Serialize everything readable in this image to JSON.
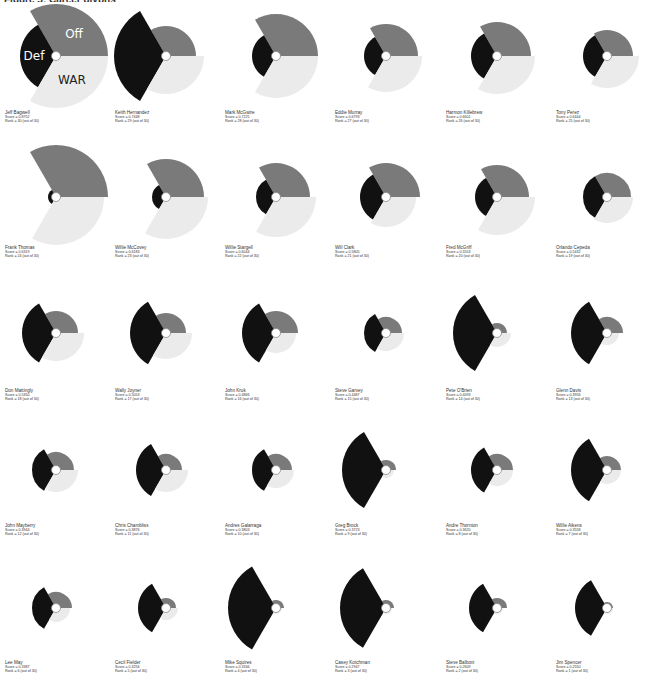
{
  "title": "Figure 5: Career glyphs",
  "chart_data": {
    "type": "radial-glyph-small-multiples",
    "title": "",
    "legend": [
      {
        "key": "Def",
        "color": "#111111",
        "angle_start": 120,
        "angle_end": 240
      },
      {
        "key": "Off",
        "color": "#7a7a7a",
        "angle_start": 0,
        "angle_end": 120
      },
      {
        "key": "WAR",
        "color": "#ebebeb",
        "angle_start": 240,
        "angle_end": 360
      }
    ],
    "grid": {
      "columns": 6,
      "rows": 6
    },
    "players": [
      {
        "name": "Jeff Bagwell",
        "score": "0.8752",
        "rank": "30",
        "def": 36,
        "off": 52,
        "war": 52,
        "show_labels": true
      },
      {
        "name": "Keith Hernandez",
        "score": "0.7448",
        "rank": "29",
        "def": 52,
        "off": 30,
        "war": 38
      },
      {
        "name": "Mark McGwire",
        "score": "0.7225",
        "rank": "28",
        "def": 24,
        "off": 42,
        "war": 42
      },
      {
        "name": "Eddie Murray",
        "score": "0.6793",
        "rank": "27",
        "def": 22,
        "off": 32,
        "war": 36
      },
      {
        "name": "Harmon Killebrew",
        "score": "0.6601",
        "rank": "26",
        "def": 26,
        "off": 34,
        "war": 38
      },
      {
        "name": "Tony Perez",
        "score": "0.6444",
        "rank": "25",
        "def": 24,
        "off": 26,
        "war": 32
      },
      {
        "name": "Frank Thomas",
        "score": "0.6319",
        "rank": "24",
        "def": 8,
        "off": 52,
        "war": 48
      },
      {
        "name": "Willie McCovey",
        "score": "0.6183",
        "rank": "23",
        "def": 14,
        "off": 38,
        "war": 42
      },
      {
        "name": "Willie Stargell",
        "score": "0.6044",
        "rank": "22",
        "def": 20,
        "off": 34,
        "war": 40
      },
      {
        "name": "Will Clark",
        "score": "0.5805",
        "rank": "21",
        "def": 26,
        "off": 34,
        "war": 30
      },
      {
        "name": "Fred McGriff",
        "score": "0.5553",
        "rank": "20",
        "def": 22,
        "off": 32,
        "war": 38
      },
      {
        "name": "Orlando Cepeda",
        "score": "0.5432",
        "rank": "19",
        "def": 24,
        "off": 24,
        "war": 26
      },
      {
        "name": "Don Mattingly",
        "score": "0.5350",
        "rank": "18",
        "def": 34,
        "off": 22,
        "war": 28
      },
      {
        "name": "Wally Joyner",
        "score": "0.5053",
        "rank": "17",
        "def": 36,
        "off": 20,
        "war": 26
      },
      {
        "name": "John Kruk",
        "score": "0.4866",
        "rank": "16",
        "def": 34,
        "off": 22,
        "war": 20
      },
      {
        "name": "Steve Garvey",
        "score": "0.4487",
        "rank": "15",
        "def": 22,
        "off": 16,
        "war": 18
      },
      {
        "name": "Pete O'Brien",
        "score": "0.4093",
        "rank": "14",
        "def": 44,
        "off": 10,
        "war": 14
      },
      {
        "name": "Glenn Davis",
        "score": "0.3956",
        "rank": "13",
        "def": 36,
        "off": 16,
        "war": 12
      },
      {
        "name": "John Mayberry",
        "score": "0.3944",
        "rank": "12",
        "def": 24,
        "off": 18,
        "war": 22
      },
      {
        "name": "Chris Chambliss",
        "score": "0.3876",
        "rank": "11",
        "def": 30,
        "off": 16,
        "war": 22
      },
      {
        "name": "Andres Galarraga",
        "score": "0.3803",
        "rank": "10",
        "def": 24,
        "off": 16,
        "war": 18
      },
      {
        "name": "Greg Brock",
        "score": "0.3723",
        "rank": "9",
        "def": 44,
        "off": 10,
        "war": 8
      },
      {
        "name": "Andre Thornton",
        "score": "0.3620",
        "rank": "8",
        "def": 26,
        "off": 16,
        "war": 16
      },
      {
        "name": "Willie Aikens",
        "score": "0.3558",
        "rank": "7",
        "def": 36,
        "off": 14,
        "war": 14
      },
      {
        "name": "Lee May",
        "score": "0.3387",
        "rank": "6",
        "def": 24,
        "off": 16,
        "war": 14
      },
      {
        "name": "Cecil Fielder",
        "score": "0.3256",
        "rank": "5",
        "def": 28,
        "off": 10,
        "war": 12
      },
      {
        "name": "Mike Squires",
        "score": "0.3166",
        "rank": "4",
        "def": 48,
        "off": 8,
        "war": 6
      },
      {
        "name": "Casey Kotchman",
        "score": "0.2947",
        "rank": "3",
        "def": 46,
        "off": 8,
        "war": 6
      },
      {
        "name": "Steve Balboni",
        "score": "0.2609",
        "rank": "2",
        "def": 28,
        "off": 10,
        "war": 6
      },
      {
        "name": "Jim Spencer",
        "score": "0.2550",
        "rank": "1",
        "def": 32,
        "off": 6,
        "war": 6
      }
    ],
    "rank_suffix": "(out of 30)",
    "score_prefix": "Score = ",
    "rank_prefix": "Rank = ",
    "wedge_labels": {
      "def": "Def",
      "off": "Off",
      "war": "WAR"
    }
  }
}
